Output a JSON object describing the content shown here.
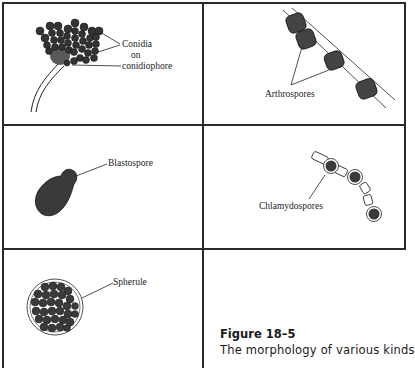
{
  "figure": {
    "panels": [
      {
        "id": "conidia",
        "labels": [
          "Conidia",
          "on",
          "conidiophore"
        ]
      },
      {
        "id": "arthrospores",
        "labels": [
          "Arthrospores"
        ]
      },
      {
        "id": "blastospore",
        "labels": [
          "Blastospore"
        ]
      },
      {
        "id": "chlamydospores",
        "labels": [
          "Chlamydospores"
        ]
      },
      {
        "id": "spherule",
        "labels": [
          "Spherule"
        ]
      }
    ],
    "caption": {
      "title": "Figure 18–5",
      "text": "The morphology of various kinds"
    },
    "colors": {
      "spore_fill": "#3a3a3a",
      "line": "#2a2a2a",
      "background": "#ffffff"
    }
  }
}
